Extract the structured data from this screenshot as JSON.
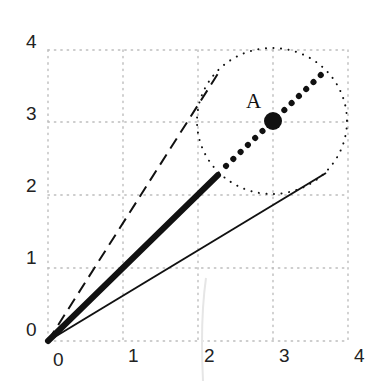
{
  "figure": {
    "type": "geometric-diagram",
    "axes": {
      "x_ticks": [
        "0",
        "1",
        "2",
        "3",
        "4"
      ],
      "y_ticks": [
        "0",
        "1",
        "2",
        "3",
        "4"
      ],
      "xlim": [
        0,
        4
      ],
      "ylim": [
        0,
        4
      ],
      "grid": "dotted"
    },
    "point": {
      "label": "A",
      "x": 2.9,
      "y": 3.0
    },
    "circle": {
      "center_label": "A",
      "cx": 2.9,
      "cy": 3.0,
      "radius": 1.0,
      "style": "dotted"
    },
    "lines": [
      {
        "name": "thick-solid",
        "from": [
          0,
          0
        ],
        "to": [
          2.27,
          2.27
        ],
        "style": "thick solid"
      },
      {
        "name": "dotted-continuation",
        "from": [
          2.27,
          2.27
        ],
        "to": [
          3.7,
          3.7
        ],
        "style": "large dots"
      },
      {
        "name": "dashed",
        "from": [
          0,
          0
        ],
        "to": [
          2.28,
          3.66
        ],
        "style": "dashed"
      },
      {
        "name": "thin-solid",
        "from": [
          0,
          0
        ],
        "to": [
          3.72,
          2.3
        ],
        "style": "thin solid"
      }
    ],
    "colors": {
      "ink": "#111111",
      "grid": "#bdbdbd",
      "background": "#ffffff"
    }
  }
}
